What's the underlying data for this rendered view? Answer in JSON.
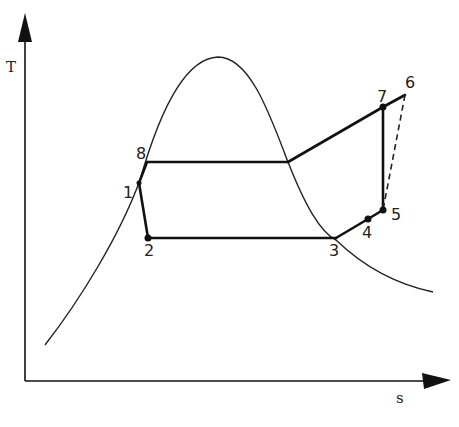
{
  "diagram": {
    "type": "T-s diagram",
    "axes": {
      "y_label": "T",
      "x_label": "s"
    },
    "states": [
      {
        "id": "1",
        "label": "1",
        "x": 139,
        "y": 183
      },
      {
        "id": "2",
        "label": "2",
        "x": 148,
        "y": 238
      },
      {
        "id": "3",
        "label": "3",
        "x": 336,
        "y": 238
      },
      {
        "id": "4",
        "label": "4",
        "x": 368,
        "y": 219
      },
      {
        "id": "5",
        "label": "5",
        "x": 383,
        "y": 210
      },
      {
        "id": "6",
        "label": "6",
        "x": 405,
        "y": 95
      },
      {
        "id": "7",
        "label": "7",
        "x": 383,
        "y": 107
      },
      {
        "id": "8",
        "label": "8",
        "x": 147,
        "y": 162
      }
    ],
    "processes": [
      {
        "from": "1",
        "to": "2",
        "style": "solid"
      },
      {
        "from": "2",
        "to": "3",
        "style": "solid"
      },
      {
        "from": "3",
        "to": "4",
        "style": "solid"
      },
      {
        "from": "4",
        "to": "5",
        "style": "solid"
      },
      {
        "from": "5",
        "to": "7",
        "style": "solid"
      },
      {
        "from": "7",
        "to": "6",
        "style": "solid"
      },
      {
        "from": "8",
        "to": "vapor-sat",
        "style": "solid"
      },
      {
        "from": "vapor-sat",
        "to": "7",
        "style": "solid"
      },
      {
        "from": "8",
        "to": "1",
        "style": "solid"
      },
      {
        "from": "6",
        "to": "5",
        "style": "dashed"
      }
    ],
    "saturation_dome": "bell-shaped saturation curve"
  }
}
